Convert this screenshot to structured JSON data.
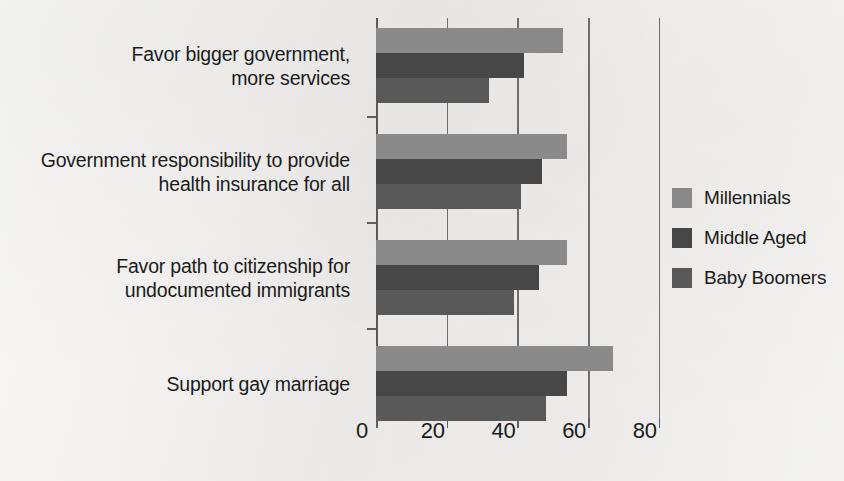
{
  "chart_data": {
    "type": "bar",
    "orientation": "horizontal",
    "title": "",
    "xlabel": "",
    "ylabel": "",
    "xlim": [
      0,
      85
    ],
    "xticks": [
      0,
      20,
      40,
      60,
      80
    ],
    "xtick_labels": [
      "0",
      "20",
      "40",
      "60",
      "80"
    ],
    "grid": true,
    "grid_axis": "x",
    "legend_position": "right",
    "categories": [
      "Favor bigger government,\nmore services",
      "Government responsibility to provide\nhealth insurance for all",
      "Favor path to citizenship for\nundocumented immigrants",
      "Support gay marriage"
    ],
    "series": [
      {
        "name": "Millennials",
        "color": "#8a8a8a",
        "values": [
          53,
          54,
          54,
          67
        ]
      },
      {
        "name": "Middle Aged",
        "color": "#474747",
        "values": [
          42,
          47,
          46,
          54
        ]
      },
      {
        "name": "Baby Boomers",
        "color": "#595959",
        "values": [
          32,
          41,
          39,
          48
        ]
      }
    ]
  },
  "legend": {
    "items": [
      {
        "label": "Millennials",
        "color": "#8a8a8a"
      },
      {
        "label": "Middle Aged",
        "color": "#474747"
      },
      {
        "label": "Baby Boomers",
        "color": "#595959"
      }
    ]
  },
  "colors": {
    "background": "#f2f1ef",
    "text": "#1b1b1b",
    "gridline": "#6e6e6e",
    "millennials": "#8a8a8a",
    "middle_aged": "#474747",
    "baby_boomers": "#595959"
  }
}
